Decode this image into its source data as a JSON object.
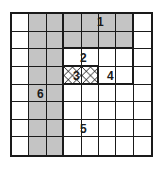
{
  "diagram": {
    "type": "grid-region-map",
    "rows": 8,
    "cols": 8,
    "colors": {
      "line": "#1a1a1a",
      "shaded": "#c4c4c4",
      "background": "#ffffff"
    },
    "regions": [
      {
        "id": "1",
        "label": "1",
        "fill": "dots",
        "cells": [
          [
            0,
            3
          ],
          [
            0,
            4
          ],
          [
            0,
            5
          ],
          [
            0,
            6
          ],
          [
            1,
            3
          ],
          [
            1,
            4
          ],
          [
            1,
            5
          ],
          [
            1,
            6
          ]
        ]
      },
      {
        "id": "2",
        "label": "2",
        "fill": "none",
        "cells": [
          [
            2,
            3
          ],
          [
            2,
            4
          ],
          [
            2,
            5
          ],
          [
            2,
            6
          ]
        ]
      },
      {
        "id": "3",
        "label": "3",
        "fill": "crosshatch",
        "cells": [
          [
            3,
            3
          ],
          [
            3,
            4
          ]
        ]
      },
      {
        "id": "4",
        "label": "4",
        "fill": "none",
        "cells": [
          [
            3,
            5
          ],
          [
            3,
            6
          ]
        ]
      },
      {
        "id": "5",
        "label": "5",
        "fill": "none",
        "cells": [
          [
            4,
            3
          ],
          [
            4,
            4
          ],
          [
            4,
            5
          ],
          [
            4,
            6
          ],
          [
            5,
            3
          ],
          [
            5,
            4
          ],
          [
            5,
            5
          ],
          [
            5,
            6
          ],
          [
            6,
            3
          ],
          [
            6,
            4
          ],
          [
            6,
            5
          ],
          [
            6,
            6
          ],
          [
            7,
            3
          ],
          [
            7,
            4
          ],
          [
            7,
            5
          ],
          [
            7,
            6
          ]
        ]
      },
      {
        "id": "6",
        "label": "6",
        "fill": "dots",
        "cells": [
          [
            0,
            1
          ],
          [
            0,
            2
          ],
          [
            1,
            1
          ],
          [
            1,
            2
          ],
          [
            2,
            1
          ],
          [
            2,
            2
          ],
          [
            3,
            1
          ],
          [
            3,
            2
          ],
          [
            4,
            1
          ],
          [
            4,
            2
          ],
          [
            5,
            1
          ],
          [
            5,
            2
          ],
          [
            6,
            1
          ],
          [
            6,
            2
          ],
          [
            7,
            1
          ],
          [
            7,
            2
          ]
        ]
      }
    ],
    "labels": {
      "r1": "1",
      "r2": "2",
      "r3": "3",
      "r4": "4",
      "r5": "5",
      "r6": "6"
    }
  }
}
